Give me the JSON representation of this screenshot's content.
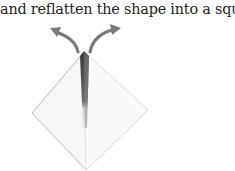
{
  "caption": "and reflatten the shape into a square.",
  "figure": {
    "colors": {
      "text": "#231f20",
      "arrow": "#7a7a7a",
      "paper_edge": "#bdbdbd",
      "paper_fill": "#f6f6f6",
      "center_fold": "#555555"
    }
  }
}
